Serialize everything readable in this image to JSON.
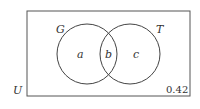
{
  "diagram": {
    "type": "venn",
    "universe_label": "U",
    "sets": [
      {
        "label": "G",
        "region_label": "a"
      },
      {
        "label": "T",
        "region_label": "c"
      }
    ],
    "intersection_label": "b",
    "outside_value": "0.42"
  }
}
